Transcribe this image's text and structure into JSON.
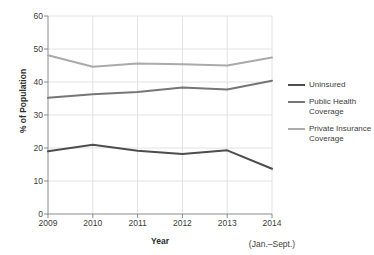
{
  "chart_data": {
    "type": "line",
    "title": "",
    "subtitle": "",
    "xlabel": "Year",
    "ylabel": "% of Population",
    "categories": [
      "2009",
      "2010",
      "2011",
      "2012",
      "2013",
      "2014"
    ],
    "x_tick_sublabels": [
      "",
      "",
      "",
      "",
      "",
      "(Jan.–Sept.)"
    ],
    "xlim": [
      2009,
      2014
    ],
    "ylim": [
      0,
      60
    ],
    "y_ticks": [
      60,
      50,
      40,
      30,
      20,
      10,
      0
    ],
    "x_ticks": [
      "2009",
      "2010",
      "2011",
      "2012",
      "2013",
      "2014"
    ],
    "grid": "horizontal-and-vertical",
    "legend_position": "right",
    "series": [
      {
        "name": "Uninsured",
        "legend_label": "Uninsured",
        "color": "#4d4d4d",
        "values": [
          19.0,
          21.0,
          19.2,
          18.2,
          19.3,
          13.7
        ]
      },
      {
        "name": "Public Health Coverage",
        "legend_label": "Public Health\nCoverage",
        "color": "#767676",
        "values": [
          35.2,
          36.3,
          37.0,
          38.3,
          37.7,
          40.4
        ]
      },
      {
        "name": "Private Insurance Coverage",
        "legend_label": "Private Insurance\nCoverage",
        "color": "#aaaaaa",
        "values": [
          48.1,
          44.6,
          45.6,
          45.4,
          45.0,
          47.4
        ]
      }
    ]
  },
  "axis": {
    "y_title": "% of Population",
    "x_title": "Year",
    "axis_color": "#8a8a8a",
    "grid_color": "#e2e2e2"
  }
}
